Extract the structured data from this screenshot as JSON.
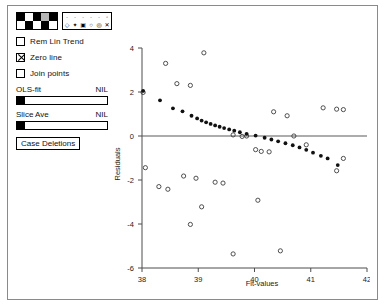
{
  "window": {
    "title": ""
  },
  "panel": {
    "color_palette": {
      "name": "color-palette",
      "rows": [
        [
          "#000000",
          "#ffffff",
          "#000000",
          "#b5b5b5",
          "#000000"
        ],
        [
          "#ffffff",
          "#000000",
          "#ffffff",
          "#000000",
          "#ffffff"
        ]
      ]
    },
    "symbol_palette": {
      "name": "symbol-palette",
      "rows": [
        [
          "·",
          "·",
          "·",
          "·",
          "·",
          "◦"
        ],
        [
          "◇",
          "✦",
          "▣",
          "○",
          "◎",
          "✕"
        ]
      ]
    },
    "checkboxes": [
      {
        "label": "Rem Lin Trend",
        "checked": false
      },
      {
        "label": "Zero line",
        "checked": true
      },
      {
        "label": "Join points",
        "checked": false
      }
    ],
    "sliders": [
      {
        "label": "OLS-fit",
        "value": "NIL",
        "position": 0
      },
      {
        "label": "Slice Ave",
        "value": "NIL",
        "position": 0
      }
    ],
    "button": {
      "label": "Case Deletions"
    }
  },
  "chart_data": {
    "type": "scatter",
    "title": "",
    "xlabel": "Fit-values",
    "ylabel": "Residuals",
    "xlim": [
      38,
      42
    ],
    "ylim": [
      -6,
      4
    ],
    "xticks": [
      38,
      39,
      40,
      41,
      42
    ],
    "yticks": [
      4,
      2,
      0,
      -2,
      -4,
      -6
    ],
    "grid": false,
    "legend": "none",
    "annotations": [
      {
        "type": "hline",
        "y": 0,
        "label": "Zero line"
      }
    ],
    "series": [
      {
        "name": "highlighted-cases",
        "marker": "filled-circle",
        "points": [
          [
            38.02,
            2.05
          ],
          [
            38.32,
            1.62
          ],
          [
            38.55,
            1.26
          ],
          [
            38.72,
            1.12
          ],
          [
            38.88,
            0.92
          ],
          [
            38.98,
            0.8
          ],
          [
            39.06,
            0.7
          ],
          [
            39.14,
            0.62
          ],
          [
            39.22,
            0.55
          ],
          [
            39.3,
            0.48
          ],
          [
            39.38,
            0.42
          ],
          [
            39.46,
            0.36
          ],
          [
            39.55,
            0.3
          ],
          [
            39.64,
            0.24
          ],
          [
            39.74,
            0.17
          ],
          [
            39.86,
            0.1
          ],
          [
            40.02,
            0.02
          ],
          [
            40.18,
            -0.08
          ],
          [
            40.3,
            -0.16
          ],
          [
            40.42,
            -0.24
          ],
          [
            40.55,
            -0.33
          ],
          [
            40.68,
            -0.42
          ],
          [
            40.8,
            -0.52
          ],
          [
            40.92,
            -0.63
          ],
          [
            41.04,
            -0.76
          ],
          [
            41.18,
            -0.9
          ],
          [
            41.3,
            -1.02
          ],
          [
            41.48,
            -1.32
          ]
        ]
      },
      {
        "name": "residual-cases",
        "marker": "open-circle",
        "points": [
          [
            38.02,
            1.98
          ],
          [
            38.42,
            3.3
          ],
          [
            38.62,
            2.38
          ],
          [
            38.86,
            2.3
          ],
          [
            39.1,
            3.78
          ],
          [
            39.62,
            0.05
          ],
          [
            39.78,
            -0.02
          ],
          [
            39.86,
            0.0
          ],
          [
            40.02,
            -0.62
          ],
          [
            40.12,
            -0.7
          ],
          [
            40.26,
            -0.72
          ],
          [
            40.34,
            1.1
          ],
          [
            40.58,
            0.92
          ],
          [
            40.7,
            0.0
          ],
          [
            40.92,
            -0.4
          ],
          [
            41.22,
            1.28
          ],
          [
            41.46,
            1.22
          ],
          [
            41.58,
            1.2
          ],
          [
            38.06,
            -1.44
          ],
          [
            38.3,
            -2.3
          ],
          [
            38.46,
            -2.42
          ],
          [
            38.74,
            -1.82
          ],
          [
            38.96,
            -1.92
          ],
          [
            39.3,
            -2.1
          ],
          [
            39.44,
            -2.14
          ],
          [
            38.86,
            -4.02
          ],
          [
            39.06,
            -3.22
          ],
          [
            40.06,
            -2.92
          ],
          [
            41.46,
            -1.58
          ],
          [
            41.58,
            -1.02
          ],
          [
            40.46,
            -5.22
          ],
          [
            39.62,
            -5.36
          ]
        ]
      }
    ]
  }
}
